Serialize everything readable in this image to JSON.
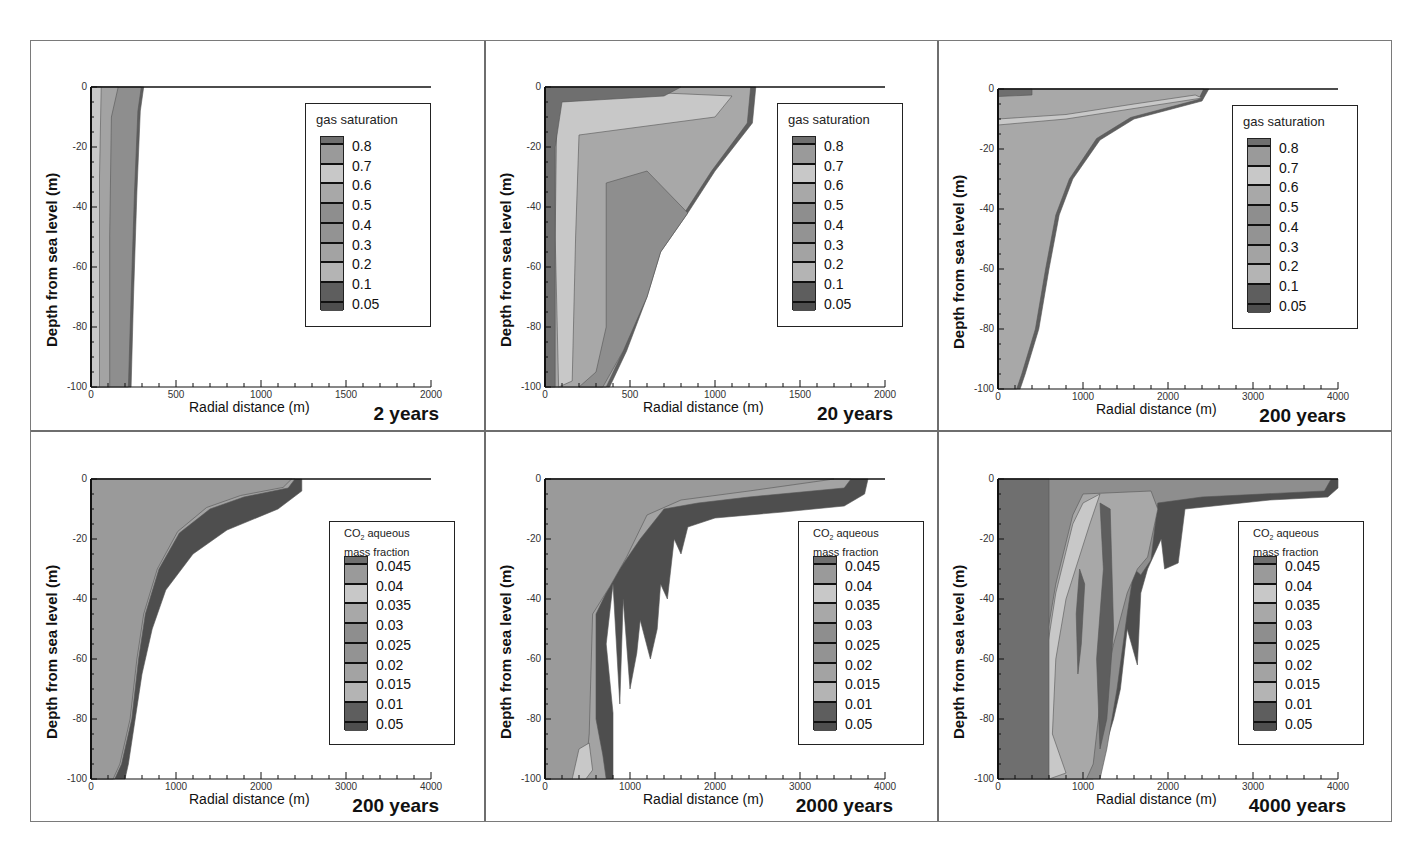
{
  "figure": {
    "panels": [
      {
        "id": "p1",
        "time_label": "2 years",
        "variable": "gas saturation",
        "xmax": 2000,
        "xticks": [
          "0",
          "500",
          "1000",
          "1500",
          "2000"
        ]
      },
      {
        "id": "p2",
        "time_label": "20 years",
        "variable": "gas saturation",
        "xmax": 2000,
        "xticks": [
          "0",
          "500",
          "1000",
          "1500",
          "2000"
        ]
      },
      {
        "id": "p3",
        "time_label": "200 years",
        "variable": "gas saturation",
        "xmax": 4000,
        "xticks": [
          "0",
          "1000",
          "2000",
          "3000",
          "4000"
        ]
      },
      {
        "id": "p4",
        "time_label": "200 years",
        "variable": "CO2 aqueous mass fraction",
        "xmax": 4000,
        "xticks": [
          "0",
          "1000",
          "2000",
          "3000",
          "4000"
        ]
      },
      {
        "id": "p5",
        "time_label": "2000 years",
        "variable": "CO2 aqueous mass fraction",
        "xmax": 4000,
        "xticks": [
          "0",
          "1000",
          "2000",
          "3000",
          "4000"
        ]
      },
      {
        "id": "p6",
        "time_label": "4000 years",
        "variable": "CO2 aqueous mass fraction",
        "xmax": 4000,
        "xticks": [
          "0",
          "1000",
          "2000",
          "3000",
          "4000"
        ]
      }
    ],
    "xlabel": "Radial distance (m)",
    "ylabel": "Depth from sea level (m)",
    "yticks": [
      "0",
      "-20",
      "-40",
      "-60",
      "-80",
      "-100"
    ],
    "legend_gas": {
      "title": "gas saturation",
      "values": [
        "0.8",
        "0.7",
        "0.6",
        "0.5",
        "0.4",
        "0.3",
        "0.2",
        "0.1",
        "0.05"
      ]
    },
    "legend_co2": {
      "title_prefix": "CO",
      "title_sub": "2",
      "title_line1_rest": " aqueous",
      "title_line2": "mass fraction",
      "values": [
        "0.045",
        "0.04",
        "0.035",
        "0.03",
        "0.025",
        "0.02",
        "0.015",
        "0.01",
        "0.05"
      ]
    },
    "colors": {
      "lvl_top": "#6f6f6f",
      "lvl_a": "#9a9a9a",
      "lvl_light": "#c8c8c8",
      "lvl_b": "#a8a8a8",
      "lvl_c": "#8e8e8e",
      "lvl_d": "#939393",
      "lvl_e": "#a3a3a3",
      "lvl_f": "#b4b4b4",
      "lvl_dark": "#5e5e5e",
      "lvl_bottom": "#4e4e4e"
    }
  },
  "chart_data": [
    {
      "type": "heatmap",
      "title": "2 years",
      "subtitle": "gas saturation",
      "xlabel": "Radial distance (m)",
      "ylabel": "Depth from sea level (m)",
      "xlim": [
        0,
        2000
      ],
      "ylim": [
        -100,
        0
      ],
      "xticks": [
        0,
        500,
        1000,
        1500,
        2000
      ],
      "yticks": [
        0,
        -20,
        -40,
        -60,
        -80,
        -100
      ],
      "legend_levels": [
        0.8,
        0.7,
        0.6,
        0.5,
        0.4,
        0.3,
        0.2,
        0.1,
        0.05
      ],
      "plume_extent": {
        "top_radius_m": 300,
        "bottom_radius_m": 230
      },
      "legend_position": "upper right"
    },
    {
      "type": "heatmap",
      "title": "20 years",
      "subtitle": "gas saturation",
      "xlabel": "Radial distance (m)",
      "ylabel": "Depth from sea level (m)",
      "xlim": [
        0,
        2000
      ],
      "ylim": [
        -100,
        0
      ],
      "xticks": [
        0,
        500,
        1000,
        1500,
        2000
      ],
      "yticks": [
        0,
        -20,
        -40,
        -60,
        -80,
        -100
      ],
      "legend_levels": [
        0.8,
        0.7,
        0.6,
        0.5,
        0.4,
        0.3,
        0.2,
        0.1,
        0.05
      ],
      "plume_extent": {
        "top_radius_m": 1230,
        "bottom_radius_m": 370
      },
      "legend_position": "upper right"
    },
    {
      "type": "heatmap",
      "title": "200 years",
      "subtitle": "gas saturation",
      "xlabel": "Radial distance (m)",
      "ylabel": "Depth from sea level (m)",
      "xlim": [
        0,
        4000
      ],
      "ylim": [
        -100,
        0
      ],
      "xticks": [
        0,
        1000,
        2000,
        3000,
        4000
      ],
      "yticks": [
        0,
        -20,
        -40,
        -60,
        -80,
        -100
      ],
      "legend_levels": [
        0.8,
        0.7,
        0.6,
        0.5,
        0.4,
        0.3,
        0.2,
        0.1,
        0.05
      ],
      "plume_extent": {
        "top_radius_m": 2450,
        "bottom_radius_m": 300
      },
      "legend_position": "upper right"
    },
    {
      "type": "heatmap",
      "title": "200 years",
      "subtitle": "CO2 aqueous mass fraction",
      "xlabel": "Radial distance (m)",
      "ylabel": "Depth from sea level (m)",
      "xlim": [
        0,
        4000
      ],
      "ylim": [
        -100,
        0
      ],
      "xticks": [
        0,
        1000,
        2000,
        3000,
        4000
      ],
      "yticks": [
        0,
        -20,
        -40,
        -60,
        -80,
        -100
      ],
      "legend_levels": [
        0.045,
        0.04,
        0.035,
        0.03,
        0.025,
        0.02,
        0.015,
        0.01,
        0.05
      ],
      "plume_extent": {
        "top_radius_m": 2470,
        "bottom_radius_m": 430
      },
      "legend_position": "right"
    },
    {
      "type": "heatmap",
      "title": "2000 years",
      "subtitle": "CO2 aqueous mass fraction",
      "xlabel": "Radial distance (m)",
      "ylabel": "Depth from sea level (m)",
      "xlim": [
        0,
        4000
      ],
      "ylim": [
        -100,
        0
      ],
      "xticks": [
        0,
        1000,
        2000,
        3000,
        4000
      ],
      "yticks": [
        0,
        -20,
        -40,
        -60,
        -80,
        -100
      ],
      "legend_levels": [
        0.045,
        0.04,
        0.035,
        0.03,
        0.025,
        0.02,
        0.015,
        0.01,
        0.05
      ],
      "plume_extent": {
        "top_radius_m": 3800,
        "bottom_radius_m": 830
      },
      "legend_position": "right"
    },
    {
      "type": "heatmap",
      "title": "4000 years",
      "subtitle": "CO2 aqueous mass fraction",
      "xlabel": "Radial distance (m)",
      "ylabel": "Depth from sea level (m)",
      "xlim": [
        0,
        4000
      ],
      "ylim": [
        -100,
        0
      ],
      "xticks": [
        0,
        1000,
        2000,
        3000,
        4000
      ],
      "yticks": [
        0,
        -20,
        -40,
        -60,
        -80,
        -100
      ],
      "legend_levels": [
        0.045,
        0.04,
        0.035,
        0.03,
        0.025,
        0.02,
        0.015,
        0.01,
        0.05
      ],
      "plume_extent": {
        "top_radius_m": 4000,
        "bottom_radius_m": 1150
      },
      "legend_position": "right"
    }
  ]
}
